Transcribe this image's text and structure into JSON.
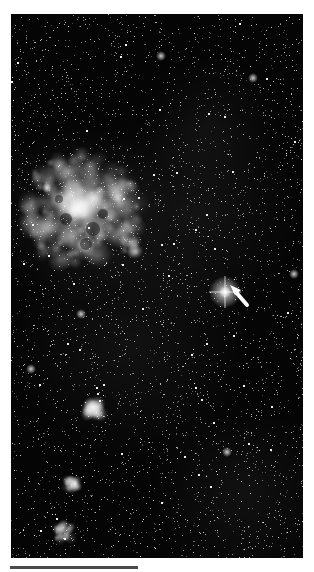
{
  "image": {
    "subject": "Star field with Tarantula Nebula and bright star marked by arrow",
    "background_color": "#050505",
    "foreground_color": "#ffffff",
    "features": [
      {
        "name": "tarantula-nebula",
        "description": "large bright emission nebula, upper left"
      },
      {
        "name": "marked-star",
        "description": "bright star with diffraction glow, right of center"
      },
      {
        "name": "pointer-arrow",
        "description": "white arrow pointing up-left at the marked star"
      },
      {
        "name": "small-nebula-mid-left",
        "description": "small bright nebula, lower-middle left"
      },
      {
        "name": "nebula-cluster-lower-left",
        "description": "pair of nebulous knots, lower left"
      }
    ]
  },
  "scale_bar": {
    "color": "#4a4a4a"
  }
}
